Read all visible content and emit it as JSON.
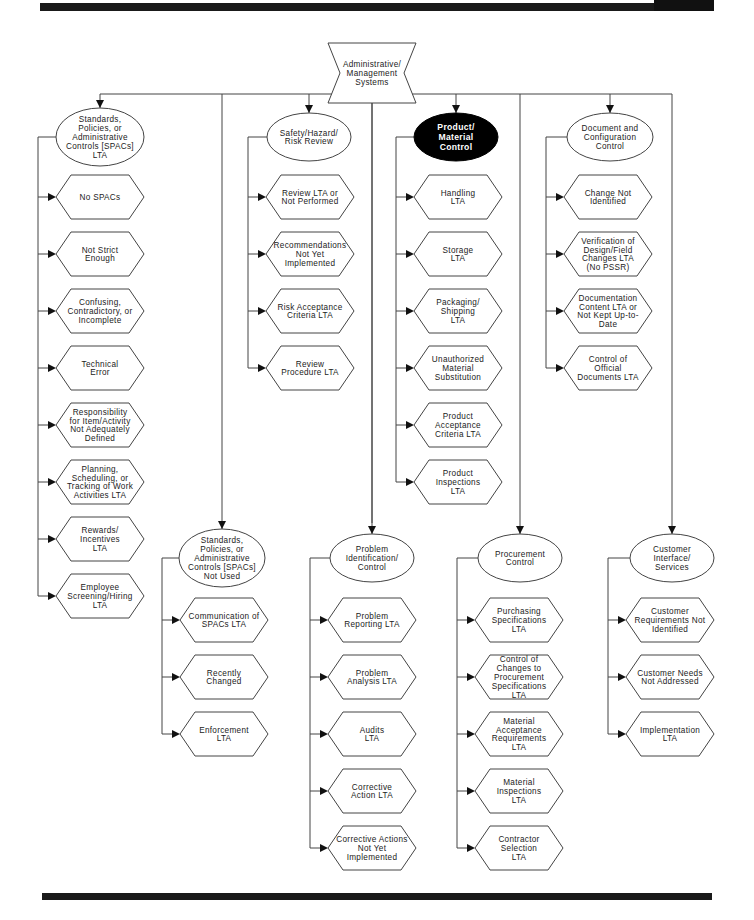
{
  "diagram": {
    "root": {
      "label": [
        "Administrative/",
        "Management",
        "Systems"
      ],
      "shape": "bowtie"
    },
    "highlight_color": "#000000",
    "branches": [
      {
        "id": "spacs-lta",
        "label": [
          "Standards,",
          "Policies, or",
          "Administrative",
          "Controls [SPACs]",
          "LTA"
        ],
        "highlighted": false,
        "children": [
          [
            "No SPACs"
          ],
          [
            "Not Strict",
            "Enough"
          ],
          [
            "Confusing,",
            "Contradictory, or",
            "Incomplete"
          ],
          [
            "Technical",
            "Error"
          ],
          [
            "Responsibility",
            "for Item/Activity",
            "Not Adequately",
            "Defined"
          ],
          [
            "Planning,",
            "Scheduling, or",
            "Tracking of Work",
            "Activities LTA"
          ],
          [
            "Rewards/",
            "Incentives",
            "LTA"
          ],
          [
            "Employee",
            "Screening/Hiring",
            "LTA"
          ]
        ]
      },
      {
        "id": "safety-hazard-risk-review",
        "label": [
          "Safety/Hazard/",
          "Risk Review"
        ],
        "highlighted": false,
        "children": [
          [
            "Review LTA or",
            "Not Performed"
          ],
          [
            "Recommendations",
            "Not Yet",
            "Implemented"
          ],
          [
            "Risk Acceptance",
            "Criteria LTA"
          ],
          [
            "Review",
            "Procedure LTA"
          ]
        ]
      },
      {
        "id": "product-material-control",
        "label": [
          "Product/",
          "Material",
          "Control"
        ],
        "highlighted": true,
        "children": [
          [
            "Handling",
            "LTA"
          ],
          [
            "Storage",
            "LTA"
          ],
          [
            "Packaging/",
            "Shipping",
            "LTA"
          ],
          [
            "Unauthorized",
            "Material",
            "Substitution"
          ],
          [
            "Product",
            "Acceptance",
            "Criteria LTA"
          ],
          [
            "Product",
            "Inspections",
            "LTA"
          ]
        ]
      },
      {
        "id": "document-configuration-control",
        "label": [
          "Document and",
          "Configuration",
          "Control"
        ],
        "highlighted": false,
        "children": [
          [
            "Change Not",
            "Identified"
          ],
          [
            "Verification of",
            "Design/Field",
            "Changes LTA",
            "(No PSSR)"
          ],
          [
            "Documentation",
            "Content LTA or",
            "Not Kept Up-to-",
            "Date"
          ],
          [
            "Control of",
            "Official",
            "Documents LTA"
          ]
        ]
      },
      {
        "id": "spacs-not-used",
        "label": [
          "Standards,",
          "Policies, or",
          "Administrative",
          "Controls [SPACs]",
          "Not Used"
        ],
        "highlighted": false,
        "children": [
          [
            "Communication of",
            "SPACs LTA"
          ],
          [
            "Recently",
            "Changed"
          ],
          [
            "Enforcement",
            "LTA"
          ]
        ]
      },
      {
        "id": "problem-identification-control",
        "label": [
          "Problem",
          "Identification/",
          "Control"
        ],
        "highlighted": false,
        "children": [
          [
            "Problem",
            "Reporting LTA"
          ],
          [
            "Problem",
            "Analysis LTA"
          ],
          [
            "Audits",
            "LTA"
          ],
          [
            "Corrective",
            "Action LTA"
          ],
          [
            "Corrective Actions",
            "Not Yet",
            "Implemented"
          ]
        ]
      },
      {
        "id": "procurement-control",
        "label": [
          "Procurement",
          "Control"
        ],
        "highlighted": false,
        "children": [
          [
            "Purchasing",
            "Specifications",
            "LTA"
          ],
          [
            "Control of",
            "Changes to",
            "Procurement",
            "Specifications",
            "LTA"
          ],
          [
            "Material",
            "Acceptance",
            "Requirements",
            "LTA"
          ],
          [
            "Material",
            "Inspections",
            "LTA"
          ],
          [
            "Contractor",
            "Selection",
            "LTA"
          ]
        ]
      },
      {
        "id": "customer-interface-services",
        "label": [
          "Customer",
          "Interface/",
          "Services"
        ],
        "highlighted": false,
        "children": [
          [
            "Customer",
            "Requirements Not",
            "Identified"
          ],
          [
            "Customer Needs",
            "Not Addressed"
          ],
          [
            "Implementation",
            "LTA"
          ]
        ]
      }
    ]
  }
}
